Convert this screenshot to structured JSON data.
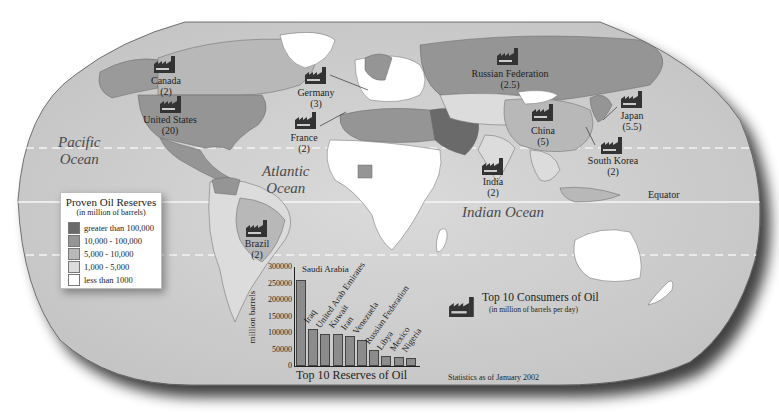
{
  "map": {
    "title": "World Oil Reserves and Consumption",
    "oceans": [
      {
        "id": "pacific",
        "line1": "Pacific",
        "line2": "Ocean"
      },
      {
        "id": "atlantic",
        "line1": "Atlantic",
        "line2": "Ocean"
      },
      {
        "id": "indian",
        "line1": "Indian Ocean",
        "line2": ""
      }
    ],
    "equator_label": "Equator",
    "colors": {
      "ocean": "#cfcfcf",
      "greater_100000": "#6a6a6a",
      "range_10000_100000": "#959595",
      "range_5000_10000": "#b8b8b8",
      "range_1000_5000": "#dcdcdc",
      "less_1000": "#ffffff"
    }
  },
  "consumers": [
    {
      "country": "Canada",
      "value": "(2)"
    },
    {
      "country": "United States",
      "value": "(20)"
    },
    {
      "country": "Germany",
      "value": "(3)"
    },
    {
      "country": "France",
      "value": "(2)"
    },
    {
      "country": "Russian Federation",
      "value": "(2.5)"
    },
    {
      "country": "China",
      "value": "(5)"
    },
    {
      "country": "Japan",
      "value": "(5.5)"
    },
    {
      "country": "South Korea",
      "value": "(2)"
    },
    {
      "country": "India",
      "value": "(2)"
    },
    {
      "country": "Brazil",
      "value": "(2)"
    }
  ],
  "legend": {
    "title": "Proven Oil Reserves",
    "subtitle": "(in million of barrels)",
    "items": [
      {
        "label": "greater than 100,000",
        "color": "#6a6a6a"
      },
      {
        "label": "10,000 - 100,000",
        "color": "#959595"
      },
      {
        "label": "5,000 - 10,000",
        "color": "#b8b8b8"
      },
      {
        "label": "1,000 - 5,000",
        "color": "#dcdcdc"
      },
      {
        "label": "less than 1000",
        "color": "#ffffff"
      }
    ]
  },
  "consumers_key": {
    "title": "Top 10 Consumers of Oil",
    "subtitle": "(in million of barrels per day)"
  },
  "footnote": "Statistics as of January 2002",
  "chart_data": {
    "type": "bar",
    "title": "Top 10 Reserves of Oil",
    "xlabel": "",
    "ylabel": "million barrels",
    "ylim": [
      0,
      300000
    ],
    "yticks": [
      "300000",
      "250000",
      "200000",
      "150000",
      "100000",
      "50000",
      "0"
    ],
    "categories": [
      "Saudi Arabia",
      "Iraq",
      "United Arab Emirates",
      "Kuwait",
      "Iran",
      "Venezuela",
      "Russian Federation",
      "Libya",
      "Mexico",
      "Nigeria"
    ],
    "values": [
      261750,
      112500,
      97800,
      96500,
      89700,
      77685,
      48573,
      29500,
      26941,
      24000
    ],
    "bar_color": "#8c8c8c",
    "grid": false,
    "legend": "none"
  }
}
